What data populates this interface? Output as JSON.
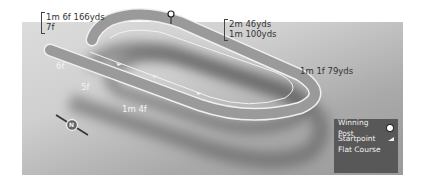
{
  "course": {
    "type": "Flat Course",
    "distances": {
      "top_left": [
        "1m 6f 166yds",
        "7f"
      ],
      "top_right": [
        "2m 46yds",
        "1m 100yds"
      ],
      "right": "1m 1f 79yds",
      "left_6f": "6f",
      "left_5f": "5f",
      "bottom": "1m 4f"
    },
    "compass": "N"
  },
  "legend": {
    "winning_post": "Winning Post",
    "startpoint": "Startpoint",
    "flat_course": "Flat Course"
  },
  "colors": {
    "panel_light": "#dcdcdc",
    "panel_dark": "#9a9a9a",
    "track": "#8f8f8f",
    "track_edge": "#f0f0f0",
    "legend_bg": "#585858"
  }
}
